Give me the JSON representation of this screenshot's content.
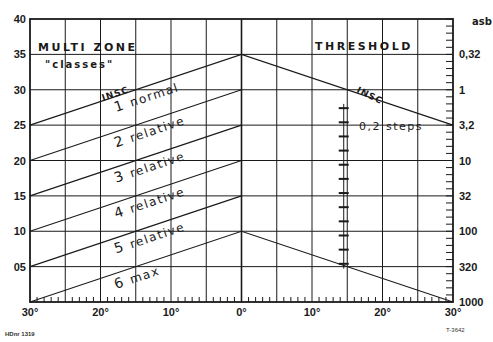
{
  "chart_data": {
    "type": "line",
    "title_left": "MULTI ZONE",
    "subtitle_left": "\"classes\"",
    "title_right": "THRESHOLD",
    "xlabel": "",
    "ylabel_left": "",
    "ylabel_right": "asb",
    "x_ticks": [
      "30°",
      "20°",
      "10°",
      "0°",
      "10°",
      "20°",
      "30°"
    ],
    "x_range": [
      -30,
      30
    ],
    "y_ticks_left": [
      "05",
      "10",
      "15",
      "20",
      "25",
      "30",
      "35",
      "40"
    ],
    "ylim": [
      0,
      40
    ],
    "y_ticks_right": [
      "0,32",
      "1",
      "3,2",
      "10",
      "32",
      "100",
      "320",
      "1000"
    ],
    "grid": true,
    "series": [
      {
        "name": "INSC",
        "x": [
          -30,
          0,
          30
        ],
        "y": [
          25,
          35,
          25
        ]
      },
      {
        "name": "1 normal",
        "x": [
          -30,
          0
        ],
        "y": [
          20,
          30
        ]
      },
      {
        "name": "2 relative",
        "x": [
          -30,
          0
        ],
        "y": [
          15,
          25
        ]
      },
      {
        "name": "3 relative",
        "x": [
          -30,
          0
        ],
        "y": [
          10,
          20
        ]
      },
      {
        "name": "4 relative",
        "x": [
          -30,
          0
        ],
        "y": [
          5,
          15
        ]
      },
      {
        "name": "5 relative / 6 max boundary",
        "x": [
          -30,
          0,
          30
        ],
        "y": [
          0,
          10,
          0
        ]
      }
    ],
    "zone_labels": [
      "INSC",
      "1 normal",
      "2 relative",
      "3 relative",
      "4 relative",
      "5 relative",
      "6 max"
    ],
    "annotations": {
      "right_insc": "INSC",
      "steps": "0,2 steps",
      "steps_range_db": [
        5,
        28
      ]
    },
    "footer_left": "HDnr 1319",
    "footer_right": "T-3642"
  }
}
